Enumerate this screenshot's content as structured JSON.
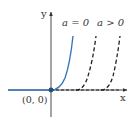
{
  "diagram": {
    "type": "function-graph",
    "axes": {
      "x_label": "x",
      "y_label": "y",
      "origin_label": "(0, 0)"
    },
    "curves": [
      {
        "name": "a-equals-0",
        "label": "a = 0",
        "style": "solid",
        "color": "#3a78b8"
      },
      {
        "name": "a-greater-0-first",
        "label": "a > 0",
        "style": "dashed",
        "color": "#222222"
      },
      {
        "name": "a-greater-0-second",
        "label": "",
        "style": "dashed",
        "color": "#222222"
      }
    ],
    "labels": {
      "a_eq_0": "a = 0",
      "a_gt_0": "a > 0"
    },
    "colors": {
      "axis": "#333333",
      "solid_curve": "#3a78b8",
      "dashed_curve": "#222222",
      "origin_point": "#1f4f7a"
    }
  }
}
